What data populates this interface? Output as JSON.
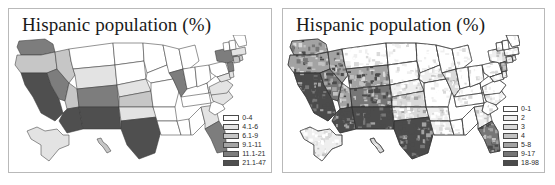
{
  "figure": {
    "background_color": "#ffffff",
    "panel_border_color": "#b9b9b9"
  },
  "panels": [
    {
      "id": "state-level-map",
      "title": "Hispanic population (%)",
      "map_type": "choropleth-us-states",
      "legend_title": "",
      "legend": [
        {
          "label": "0-4",
          "color": "#ffffff"
        },
        {
          "label": "4.1-6",
          "color": "#e3e3e3"
        },
        {
          "label": "6.1-9",
          "color": "#c6c6c6"
        },
        {
          "label": "9.1-11",
          "color": "#a5a5a5"
        },
        {
          "label": "11.1-21",
          "color": "#7d7d7d"
        },
        {
          "label": "21.1-47",
          "color": "#4f4f4f"
        }
      ]
    },
    {
      "id": "county-level-map",
      "title": "Hispanic population (%)",
      "map_type": "choropleth-us-counties",
      "legend_title": "",
      "legend": [
        {
          "label": "0-1",
          "color": "#ffffff"
        },
        {
          "label": "2",
          "color": "#efefef"
        },
        {
          "label": "3",
          "color": "#dadada"
        },
        {
          "label": "4",
          "color": "#c2c2c2"
        },
        {
          "label": "5-8",
          "color": "#a3a3a3"
        },
        {
          "label": "9-17",
          "color": "#767676"
        },
        {
          "label": "18-98",
          "color": "#4b4b4b"
        }
      ]
    }
  ],
  "chart_data": {
    "type": "heatmap",
    "title": "Hispanic population (%)",
    "subtitle": "",
    "xlabel": "",
    "ylabel": "",
    "legend_position": "bottom-right",
    "grid": false,
    "maps": [
      {
        "name": "Hispanic population (%) - state level",
        "unit": "percent",
        "bins": [
          "0-4",
          "4.1-6",
          "6.1-9",
          "9.1-11",
          "11.1-21",
          "21.1-47"
        ],
        "bin_colors": [
          "#ffffff",
          "#e3e3e3",
          "#c6c6c6",
          "#a5a5a5",
          "#7d7d7d",
          "#4f4f4f"
        ],
        "regions": [
          {
            "code": "WA",
            "bin": "11.1-21"
          },
          {
            "code": "OR",
            "bin": "6.1-9"
          },
          {
            "code": "CA",
            "bin": "21.1-47"
          },
          {
            "code": "NV",
            "bin": "11.1-21"
          },
          {
            "code": "ID",
            "bin": "6.1-9"
          },
          {
            "code": "MT",
            "bin": "0-4"
          },
          {
            "code": "WY",
            "bin": "4.1-6"
          },
          {
            "code": "UT",
            "bin": "6.1-9"
          },
          {
            "code": "AZ",
            "bin": "21.1-47"
          },
          {
            "code": "NM",
            "bin": "21.1-47"
          },
          {
            "code": "CO",
            "bin": "11.1-21"
          },
          {
            "code": "ND",
            "bin": "0-4"
          },
          {
            "code": "SD",
            "bin": "0-4"
          },
          {
            "code": "NE",
            "bin": "4.1-6"
          },
          {
            "code": "KS",
            "bin": "6.1-9"
          },
          {
            "code": "OK",
            "bin": "4.1-6"
          },
          {
            "code": "TX",
            "bin": "21.1-47"
          },
          {
            "code": "MN",
            "bin": "0-4"
          },
          {
            "code": "IA",
            "bin": "0-4"
          },
          {
            "code": "MO",
            "bin": "0-4"
          },
          {
            "code": "AR",
            "bin": "0-4"
          },
          {
            "code": "LA",
            "bin": "0-4"
          },
          {
            "code": "WI",
            "bin": "0-4"
          },
          {
            "code": "IL",
            "bin": "11.1-21"
          },
          {
            "code": "MS",
            "bin": "0-4"
          },
          {
            "code": "MI",
            "bin": "0-4"
          },
          {
            "code": "IN",
            "bin": "0-4"
          },
          {
            "code": "KY",
            "bin": "0-4"
          },
          {
            "code": "TN",
            "bin": "0-4"
          },
          {
            "code": "AL",
            "bin": "0-4"
          },
          {
            "code": "OH",
            "bin": "0-4"
          },
          {
            "code": "WV",
            "bin": "0-4"
          },
          {
            "code": "GA",
            "bin": "4.1-6"
          },
          {
            "code": "FL",
            "bin": "11.1-21"
          },
          {
            "code": "SC",
            "bin": "0-4"
          },
          {
            "code": "NC",
            "bin": "4.1-6"
          },
          {
            "code": "VA",
            "bin": "4.1-6"
          },
          {
            "code": "PA",
            "bin": "0-4"
          },
          {
            "code": "NY",
            "bin": "11.1-21"
          },
          {
            "code": "NJ",
            "bin": "11.1-21"
          },
          {
            "code": "MD",
            "bin": "4.1-6"
          },
          {
            "code": "DE",
            "bin": "4.1-6"
          },
          {
            "code": "CT",
            "bin": "6.1-9"
          },
          {
            "code": "RI",
            "bin": "6.1-9"
          },
          {
            "code": "MA",
            "bin": "4.1-6"
          },
          {
            "code": "VT",
            "bin": "0-4"
          },
          {
            "code": "NH",
            "bin": "0-4"
          },
          {
            "code": "ME",
            "bin": "0-4"
          },
          {
            "code": "AK",
            "bin": "4.1-6"
          },
          {
            "code": "HI",
            "bin": "6.1-9"
          }
        ]
      },
      {
        "name": "Hispanic population (%) - county level",
        "unit": "percent",
        "bins": [
          "0-1",
          "2",
          "3",
          "4",
          "5-8",
          "9-17",
          "18-98"
        ],
        "bin_colors": [
          "#ffffff",
          "#efefef",
          "#dadada",
          "#c2c2c2",
          "#a3a3a3",
          "#767676",
          "#4b4b4b"
        ],
        "regions": [
          {
            "code": "WA",
            "bin": "5-8"
          },
          {
            "code": "OR",
            "bin": "5-8"
          },
          {
            "code": "CA",
            "bin": "18-98"
          },
          {
            "code": "NV",
            "bin": "9-17"
          },
          {
            "code": "ID",
            "bin": "5-8"
          },
          {
            "code": "MT",
            "bin": "0-1"
          },
          {
            "code": "WY",
            "bin": "5-8"
          },
          {
            "code": "UT",
            "bin": "5-8"
          },
          {
            "code": "AZ",
            "bin": "18-98"
          },
          {
            "code": "NM",
            "bin": "18-98"
          },
          {
            "code": "CO",
            "bin": "9-17"
          },
          {
            "code": "ND",
            "bin": "0-1"
          },
          {
            "code": "SD",
            "bin": "0-1"
          },
          {
            "code": "NE",
            "bin": "2"
          },
          {
            "code": "KS",
            "bin": "3"
          },
          {
            "code": "OK",
            "bin": "3"
          },
          {
            "code": "TX",
            "bin": "18-98"
          },
          {
            "code": "MN",
            "bin": "0-1"
          },
          {
            "code": "IA",
            "bin": "2"
          },
          {
            "code": "MO",
            "bin": "0-1"
          },
          {
            "code": "AR",
            "bin": "2"
          },
          {
            "code": "LA",
            "bin": "2"
          },
          {
            "code": "WI",
            "bin": "0-1"
          },
          {
            "code": "IL",
            "bin": "3"
          },
          {
            "code": "MS",
            "bin": "0-1"
          },
          {
            "code": "MI",
            "bin": "0-1"
          },
          {
            "code": "IN",
            "bin": "0-1"
          },
          {
            "code": "KY",
            "bin": "0-1"
          },
          {
            "code": "TN",
            "bin": "0-1"
          },
          {
            "code": "AL",
            "bin": "0-1"
          },
          {
            "code": "OH",
            "bin": "0-1"
          },
          {
            "code": "WV",
            "bin": "0-1"
          },
          {
            "code": "GA",
            "bin": "2"
          },
          {
            "code": "FL",
            "bin": "9-17"
          },
          {
            "code": "SC",
            "bin": "0-1"
          },
          {
            "code": "NC",
            "bin": "2"
          },
          {
            "code": "VA",
            "bin": "0-1"
          },
          {
            "code": "PA",
            "bin": "0-1"
          },
          {
            "code": "NY",
            "bin": "2"
          },
          {
            "code": "NJ",
            "bin": "5-8"
          },
          {
            "code": "MD",
            "bin": "2"
          },
          {
            "code": "DE",
            "bin": "2"
          },
          {
            "code": "CT",
            "bin": "3"
          },
          {
            "code": "RI",
            "bin": "3"
          },
          {
            "code": "MA",
            "bin": "2"
          },
          {
            "code": "VT",
            "bin": "0-1"
          },
          {
            "code": "NH",
            "bin": "0-1"
          },
          {
            "code": "ME",
            "bin": "0-1"
          },
          {
            "code": "AK",
            "bin": "2"
          },
          {
            "code": "HI",
            "bin": "3"
          }
        ]
      }
    ]
  }
}
